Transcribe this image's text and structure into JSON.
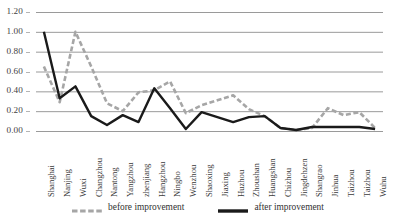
{
  "chart_data": {
    "type": "line",
    "title": "",
    "subtitle": "",
    "xlabel": "",
    "ylabel": "",
    "ylim": [
      0.0,
      1.2
    ],
    "ytick_labels": [
      "1.20",
      "1.00",
      "0.80",
      "0.60",
      "0.40",
      "0.20",
      "0.00"
    ],
    "ytick_values": [
      1.2,
      1.0,
      0.8,
      0.6,
      0.4,
      0.2,
      0.0
    ],
    "grid": true,
    "grid_axis": "y",
    "legend_position": "bottom-center",
    "categories": [
      "Shanghai",
      "Nanjing",
      "Wuxi",
      "Changzhou",
      "Nantong",
      "Yangzhou",
      "zhenjiang",
      "Hangzhou",
      "Ningbo",
      "Wenzhou",
      "Shaoxing",
      "Jiaxing",
      "Huzhou",
      "Zhoushan",
      "Huangshan",
      "Chizhou",
      "Jingdehzen",
      "Shangrao",
      "Jinhua",
      "Taizhou",
      "Taizhou",
      "Wuhu"
    ],
    "series": [
      {
        "name": "before improvement",
        "style": "dashed",
        "color": "#a6a6a6",
        "values": [
          0.65,
          0.29,
          1.0,
          0.65,
          0.28,
          0.2,
          0.39,
          0.41,
          0.5,
          0.18,
          0.26,
          0.31,
          0.36,
          0.22,
          0.15,
          0.03,
          0.01,
          0.03,
          0.23,
          0.16,
          0.19,
          0.03
        ]
      },
      {
        "name": "after improvement",
        "style": "solid",
        "color": "#1a1a1a",
        "values": [
          1.0,
          0.33,
          0.45,
          0.15,
          0.06,
          0.16,
          0.09,
          0.43,
          0.23,
          0.02,
          0.19,
          0.14,
          0.09,
          0.14,
          0.15,
          0.03,
          0.01,
          0.04,
          0.04,
          0.04,
          0.04,
          0.02
        ]
      }
    ]
  },
  "legend": {
    "items": [
      {
        "label": "before improvement"
      },
      {
        "label": "after improvement"
      }
    ]
  },
  "colors": {
    "gridline": "#8f8f8f",
    "series_before": "#a6a6a6",
    "series_after": "#1a1a1a",
    "text": "#3a3a3a",
    "background": "#ffffff"
  }
}
